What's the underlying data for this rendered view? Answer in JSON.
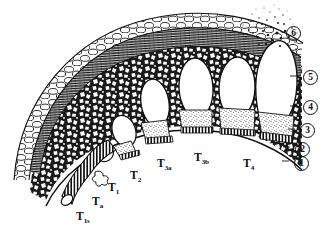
{
  "figure": {
    "background_color": "#ffffff",
    "ink_color": "#111111",
    "width": 326,
    "height": 234
  },
  "cavity_labels": [
    {
      "name": "t-1s",
      "base": "T",
      "sub": "1s",
      "x": 76,
      "y": 211,
      "font_size": 11.5
    },
    {
      "name": "t-a",
      "base": "T",
      "sub": "a",
      "x": 92,
      "y": 196,
      "font_size": 11.5
    },
    {
      "name": "t-1",
      "base": "T",
      "sub": "1",
      "x": 108,
      "y": 182,
      "font_size": 11.5
    },
    {
      "name": "t-2",
      "base": "T",
      "sub": "2",
      "x": 130,
      "y": 170,
      "font_size": 11.5
    },
    {
      "name": "t-3a",
      "base": "T",
      "sub": "3a",
      "x": 157,
      "y": 158,
      "font_size": 11.5
    },
    {
      "name": "t-3b",
      "base": "T",
      "sub": "3b",
      "x": 194,
      "y": 152,
      "font_size": 11.5
    },
    {
      "name": "t-4",
      "base": "T",
      "sub": "4",
      "x": 243,
      "y": 158,
      "font_size": 11.5
    }
  ],
  "layer_callouts": [
    {
      "name": "layer-6",
      "value": "6",
      "x": 286,
      "y": 26
    },
    {
      "name": "layer-5",
      "value": "5",
      "x": 303,
      "y": 70
    },
    {
      "name": "layer-4",
      "value": "4",
      "x": 303,
      "y": 100
    },
    {
      "name": "layer-3",
      "value": "3",
      "x": 300,
      "y": 123
    },
    {
      "name": "layer-2",
      "value": "2",
      "x": 295,
      "y": 142
    },
    {
      "name": "layer-1",
      "value": "1",
      "x": 294,
      "y": 156
    }
  ],
  "structures": {
    "cortex_band": "outer cobblestone cell layer",
    "fiber_band": "hatched fibrous band",
    "parenchyma": "reticulate inner ground tissue",
    "cavities": "oval lacunae of increasing size",
    "stalk": "tubular stalk at lower left",
    "eruption": "stippled particle spray at upper right"
  }
}
